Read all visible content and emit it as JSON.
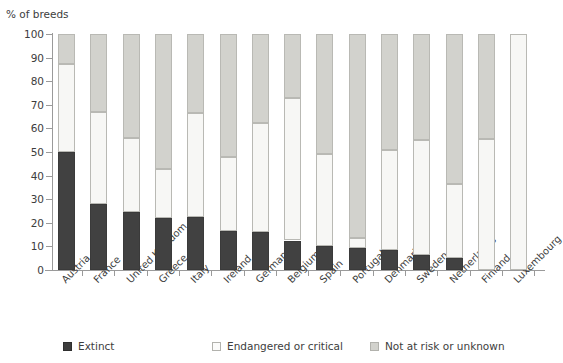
{
  "chart_data": {
    "type": "bar",
    "subtype": "stacked-bar-100-percent",
    "title": "",
    "ylabel": "% of breeds",
    "xlabel": "",
    "ylim": [
      0,
      100
    ],
    "yticks": [
      0,
      10,
      20,
      30,
      40,
      50,
      60,
      70,
      80,
      90,
      100
    ],
    "ytick_labels": [
      "0",
      "10",
      "20",
      "30",
      "40",
      "50",
      "60",
      "70",
      "80",
      "90",
      "100"
    ],
    "grid": false,
    "legend_position": "bottom",
    "categories": [
      "Austria",
      "France",
      "United Kingdom",
      "Greece",
      "Italy",
      "Ireland",
      "Germany",
      "Belgium",
      "Spain",
      "Portugal",
      "Denmark",
      "Sweden",
      "Netherlands",
      "Finland",
      "Luxembourg"
    ],
    "series": [
      {
        "name": "Extinct",
        "color": "#414141",
        "values": [
          50,
          28,
          24.5,
          22,
          22.5,
          16.5,
          16,
          12.5,
          10,
          9.5,
          8.5,
          6.5,
          5,
          0,
          0
        ]
      },
      {
        "name": "Endangered or critical",
        "color": "#f7f7f5",
        "values": [
          37.5,
          39,
          31.5,
          21,
          44,
          31.5,
          46.5,
          60.5,
          39,
          4,
          42.5,
          48.5,
          31.5,
          55.5,
          100
        ]
      },
      {
        "name": "Not at risk or unknown",
        "color": "#d2d2cd",
        "values": [
          12.5,
          33,
          44,
          57,
          33.5,
          52,
          37.5,
          27,
          51,
          86.5,
          49,
          45,
          63.5,
          44.5,
          0
        ]
      }
    ]
  },
  "legend": {
    "items": [
      {
        "label": "Extinct",
        "swatch": "sw-extinct"
      },
      {
        "label": "Endangered or critical",
        "swatch": "sw-endangered"
      },
      {
        "label": "Not at risk or unknown",
        "swatch": "sw-notatrisk"
      }
    ]
  }
}
